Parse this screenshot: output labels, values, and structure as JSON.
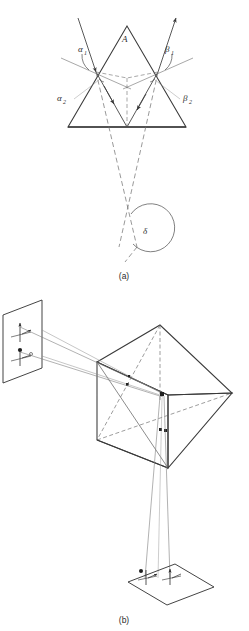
{
  "figure": {
    "type": "optics-ray-diagram",
    "background_color": "#ffffff",
    "line_color": "#3a3a3a",
    "light_line_color": "#8a8a8a",
    "panels": [
      {
        "id": "a",
        "caption": "(a)",
        "description": "Two-dimensional ray trace through a triangular prism showing refraction at entry and exit faces, internal reflection at the base, and the resulting angular deviation."
      },
      {
        "id": "b",
        "caption": "(b)",
        "description": "Three-dimensional perspective view of a prism with an object plane at left and an image plane below, showing ray bundles and orientation arrow markers."
      }
    ]
  },
  "panel_a": {
    "caption": "(a)",
    "apex_label": "A",
    "labels": {
      "alpha1": "α",
      "alpha1_sub": "1",
      "alpha2": "α",
      "alpha2_sub": "2",
      "beta1": "β",
      "beta1_sub": "1",
      "beta2": "β",
      "beta2_sub": "2",
      "delta": "δ"
    },
    "label_names": {
      "apex": "apex-angle-A",
      "alpha1": "incidence-angle-alpha-1",
      "alpha2": "refraction-angle-alpha-2",
      "beta1": "exit-angle-beta-1",
      "beta2": "internal-angle-beta-2",
      "delta": "deviation-angle-delta"
    },
    "prism": {
      "apex": [
        127,
        26
      ],
      "base_left": [
        68,
        127
      ],
      "base_right": [
        186,
        127
      ],
      "entry_point": [
        96,
        72
      ],
      "exit_point": [
        158,
        72
      ],
      "base_reflection_point": [
        127,
        127
      ]
    }
  },
  "panel_b": {
    "caption": "(b)",
    "object_plane_label": "object-plane",
    "image_plane_label": "image-plane",
    "prism_label": "prism-3d",
    "marker_symbols": {
      "arrow_marker": "orientation-arrow",
      "dot_marker": "ray-point-marker"
    }
  }
}
